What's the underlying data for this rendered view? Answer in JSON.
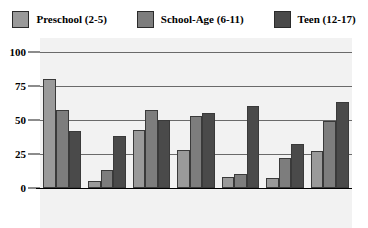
{
  "chart_data": {
    "type": "bar",
    "title": "",
    "subtitle": "",
    "xlabel": "",
    "ylabel": "",
    "ylim": [
      0,
      100
    ],
    "yticks": [
      0,
      25,
      50,
      75,
      100
    ],
    "ytick_labels": [
      "0",
      "25",
      "50",
      "75",
      "100"
    ],
    "grid": true,
    "legend_position": "top",
    "categories": [
      "VCR",
      "Internet",
      "Books",
      "Video\nGames",
      "Telephone",
      "Periodicals",
      "Computer"
    ],
    "series": [
      {
        "name": "Preschool (2-5)",
        "color": "#9a9a9a",
        "values": [
          80,
          5,
          43,
          28,
          8,
          7,
          27
        ]
      },
      {
        "name": "School-Age (6-11)",
        "color": "#7d7d7d",
        "values": [
          57,
          13,
          57,
          53,
          10,
          22,
          49
        ]
      },
      {
        "name": "Teen (12-17)",
        "color": "#4a4a4a",
        "values": [
          42,
          38,
          50,
          55,
          60,
          32,
          63
        ]
      }
    ]
  },
  "legend": {
    "entries": [
      {
        "label": "Preschool (2-5)",
        "color": "#9a9a9a",
        "swatch_name": "legend-swatch-preschool"
      },
      {
        "label": "School-Age (6-11)",
        "color": "#7d7d7d",
        "swatch_name": "legend-swatch-school-age"
      },
      {
        "label": "Teen (12-17)",
        "color": "#4a4a4a",
        "swatch_name": "legend-swatch-teen"
      }
    ]
  },
  "colors": {
    "plot_background": "#f2f2f2",
    "page_background": "#ffffff",
    "gridline": "#6a6a6a",
    "axis": "#000000",
    "bar_border": "#3a3a3a"
  }
}
